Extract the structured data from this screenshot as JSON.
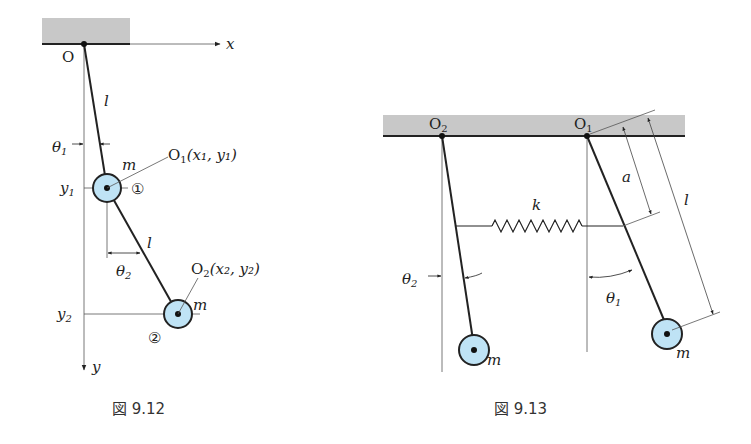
{
  "figures": [
    {
      "id": "fig-9-12",
      "caption": "図 9.12",
      "labels": {
        "origin": "O",
        "x_axis": "x",
        "y_axis": "y",
        "rod1_length": "l",
        "rod2_length": "l",
        "theta1": "θ",
        "theta1_sub": "1",
        "theta2": "θ",
        "theta2_sub": "2",
        "mass1": "m",
        "mass2": "m",
        "y1": "y",
        "y1_sub": "1",
        "y2": "y",
        "y2_sub": "2",
        "point1_name": "O",
        "point1_sub": "1",
        "point1_coords": "(x₁, y₁)",
        "point2_name": "O",
        "point2_sub": "2",
        "point2_coords": "(x₂, y₂)",
        "circle1": "①",
        "circle2": "②"
      }
    },
    {
      "id": "fig-9-13",
      "caption": "図 9.13",
      "labels": {
        "pivot_left": "O",
        "pivot_left_sub": "2",
        "pivot_right": "O",
        "pivot_right_sub": "1",
        "spring_constant": "k",
        "spring_attach_distance": "a",
        "rod_length": "l",
        "theta1": "θ",
        "theta1_sub": "1",
        "theta2": "θ",
        "theta2_sub": "2",
        "mass_left": "m",
        "mass_right": "m"
      }
    }
  ],
  "colors": {
    "mass_fill": "#bfe3f5",
    "ceiling_fill": "#c8c8c8",
    "line": "#222222"
  }
}
